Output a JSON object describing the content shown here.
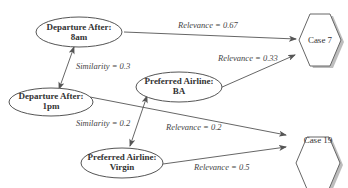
{
  "diagram": {
    "nodes": {
      "dep8": {
        "line1": "Departure After:",
        "line2": "8am"
      },
      "dep1": {
        "line1": "Departure After:",
        "line2": "1pm"
      },
      "ba": {
        "line1": "Preferred Airline:",
        "line2": "BA"
      },
      "virgin": {
        "line1": "Preferred Airline:",
        "line2": "Virgin"
      },
      "case7": {
        "label": "Case 7"
      },
      "case19": {
        "label": "Case 19"
      }
    },
    "edges": {
      "dep8_case7": {
        "label": "Relevance = 0.67"
      },
      "ba_case7": {
        "label": "Relevance = 0.33"
      },
      "dep1_case19": {
        "label": "Relevance = 0.2"
      },
      "virgin_case19": {
        "label": "Relevance = 0.5"
      },
      "dep8_dep1": {
        "label": "Similarity = 0.3"
      },
      "ba_virgin": {
        "label": "Similarity = 0.2"
      }
    }
  }
}
